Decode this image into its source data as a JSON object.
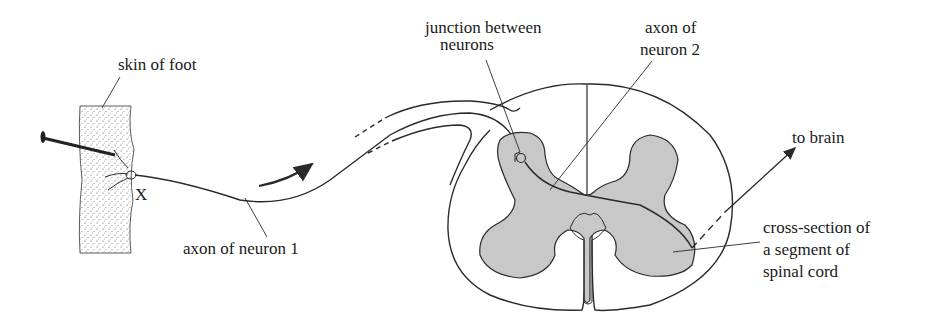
{
  "diagram": {
    "labels": {
      "skin_of_foot": "skin of foot",
      "x_marker": "X",
      "axon_neuron_1": "axon of neuron 1",
      "junction_line1": "junction between",
      "junction_line2": "neurons",
      "axon_neuron_2_line1": "axon of",
      "axon_neuron_2_line2": "neuron 2",
      "to_brain": "to brain",
      "cross_section_line1": "cross-section of",
      "cross_section_line2": "a segment of",
      "cross_section_line3": "spinal cord"
    },
    "colors": {
      "ink": "#2a2a2a",
      "grey_matter": "#c8c8c8",
      "background": "#ffffff"
    }
  }
}
